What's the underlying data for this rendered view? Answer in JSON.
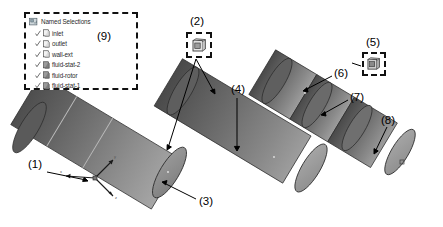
{
  "tree": {
    "root_icon": "named-selections-icon",
    "root_label": "Named Selections",
    "items": [
      {
        "label": "inlet",
        "icon": "face-selection-icon",
        "checked": true
      },
      {
        "label": "outlet",
        "icon": "face-selection-icon",
        "checked": true
      },
      {
        "label": "wall-ext",
        "icon": "face-selection-icon",
        "checked": true
      },
      {
        "label": "fluid-stat-2",
        "icon": "body-selection-icon",
        "checked": true
      },
      {
        "label": "fluid-rotor",
        "icon": "body-selection-icon",
        "checked": true
      },
      {
        "label": "fluid-stat-1",
        "icon": "body-selection-icon",
        "checked": true
      }
    ]
  },
  "tool_boxes": [
    {
      "id": "tool-box-2",
      "icon": "body-cube-icon"
    },
    {
      "id": "tool-box-5",
      "icon": "body-cube-icon"
    }
  ],
  "callouts": [
    {
      "id": "callout-1",
      "label": "(1)"
    },
    {
      "id": "callout-2",
      "label": "(2)"
    },
    {
      "id": "callout-3",
      "label": "(3)"
    },
    {
      "id": "callout-4",
      "label": "(4)"
    },
    {
      "id": "callout-5",
      "label": "(5)"
    },
    {
      "id": "callout-6",
      "label": "(6)"
    },
    {
      "id": "callout-7",
      "label": "(7)"
    },
    {
      "id": "callout-8",
      "label": "(8)"
    },
    {
      "id": "callout-9",
      "label": "(9)"
    }
  ],
  "axis_triad": {
    "x_label": "x",
    "y_label": "y",
    "z_label": "z"
  },
  "colors": {
    "cylinder_dark": "#555555",
    "cylinder_mid": "#6d6d6d",
    "cylinder_light": "#9a9a9a",
    "cap_face": "#8b8b8b",
    "outline": "#111111",
    "panel_border": "#111111",
    "background": "#ffffff"
  },
  "viewport": {
    "width": 443,
    "height": 227
  }
}
